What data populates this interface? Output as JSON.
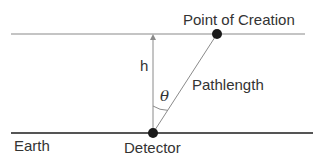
{
  "diagram": {
    "labels": {
      "point_of_creation": "Point of Creation",
      "height": "h",
      "pathlength": "Pathlength",
      "angle": "θ",
      "earth": "Earth",
      "detector": "Detector"
    },
    "geometry": {
      "top_line": {
        "x1": 11,
        "y": 34,
        "x2": 305
      },
      "earth_line": {
        "x1": 11,
        "y": 133,
        "x2": 313
      },
      "detector_point": {
        "x": 153,
        "y": 133
      },
      "creation_point": {
        "x": 217,
        "y": 34
      }
    },
    "colors": {
      "top_line": "#8a8a8a",
      "earth_line": "#555555",
      "dots": "#1a1a1a",
      "text": "#333333",
      "thin_lines": "#8a8a8a"
    }
  }
}
